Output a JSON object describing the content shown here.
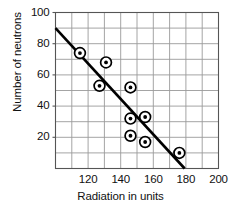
{
  "chart_data": {
    "type": "scatter",
    "title": "",
    "xlabel": "Radiation in units",
    "ylabel": "Number of neutrons",
    "xlim": [
      100,
      200
    ],
    "ylim": [
      0,
      100
    ],
    "xticks": [
      120,
      140,
      160,
      180,
      200
    ],
    "yticks": [
      20,
      40,
      60,
      80,
      100
    ],
    "xtick_labels": [
      "120",
      "140",
      "160",
      "180",
      "200"
    ],
    "ytick_labels": [
      "20",
      "40",
      "60",
      "80",
      "100"
    ],
    "grid": true,
    "grid_step_x": 10,
    "grid_step_y": 10,
    "legend": "none",
    "marker": "circled-dot",
    "points": [
      {
        "x": 115,
        "y": 74
      },
      {
        "x": 131,
        "y": 68
      },
      {
        "x": 127,
        "y": 53
      },
      {
        "x": 146,
        "y": 52
      },
      {
        "x": 146,
        "y": 32
      },
      {
        "x": 155,
        "y": 33
      },
      {
        "x": 146,
        "y": 21
      },
      {
        "x": 155,
        "y": 17
      },
      {
        "x": 176,
        "y": 10
      }
    ],
    "trend_line": {
      "label": "",
      "x1": 100,
      "y1": 90,
      "x2": 181,
      "y2": -2
    },
    "colors": {
      "marker": "#000000",
      "line": "#000000",
      "grid": "#9a9a9a",
      "axis": "#555555",
      "background": "#ffffff",
      "text": "#111111"
    }
  }
}
